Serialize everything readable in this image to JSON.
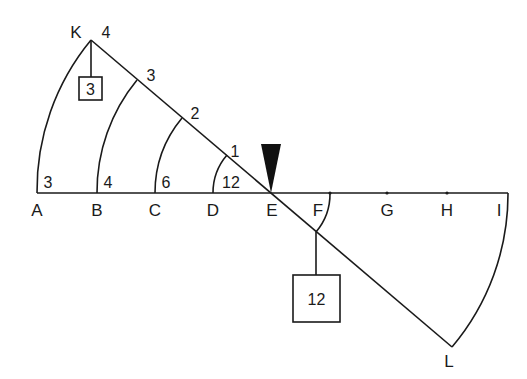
{
  "diagram": {
    "fulcrum": {
      "label": "E",
      "icon": "fulcrum-triangle"
    },
    "baseline_points": [
      "A",
      "B",
      "C",
      "D",
      "E",
      "F",
      "G",
      "H",
      "I"
    ],
    "beam_end_points": {
      "top_left": "K",
      "bottom_right": "L"
    },
    "arc_labels_on_baseline": {
      "A": "3",
      "B": "4",
      "C": "6",
      "D": "12"
    },
    "arc_labels_on_beam": {
      "K": "4",
      "B_arc": "3",
      "C_arc": "2",
      "D_arc": "1"
    },
    "weights": [
      {
        "position": "K",
        "value": "3"
      },
      {
        "position": "F",
        "value": "12"
      }
    ]
  }
}
